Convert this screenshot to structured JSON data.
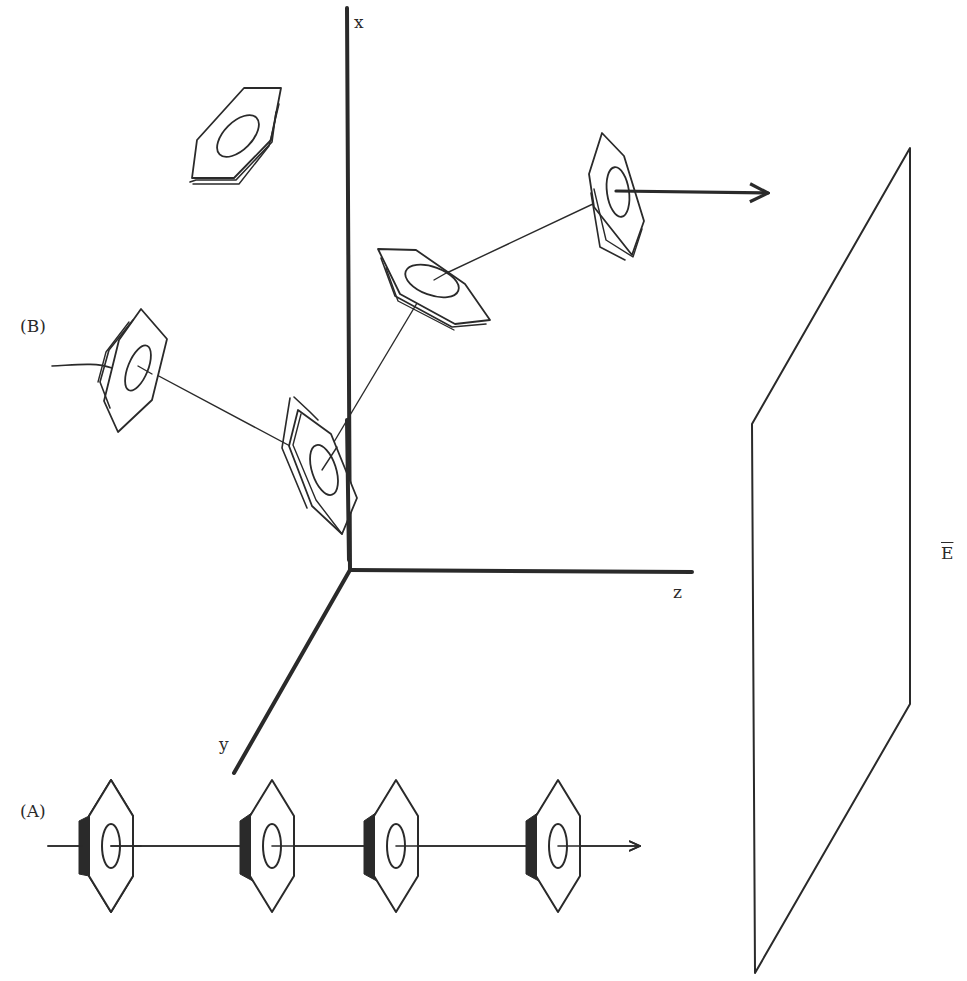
{
  "figure": {
    "type": "3D schematic diagram",
    "stroke_color": "#2a2a2a",
    "background": "#ffffff"
  },
  "axes": {
    "x": {
      "label": "x",
      "direction": "up"
    },
    "y": {
      "label": "y",
      "direction": "down-left"
    },
    "z": {
      "label": "z",
      "direction": "right"
    },
    "origin": [
      350,
      570
    ]
  },
  "field": {
    "label": "E",
    "overline": true,
    "plate": "parallelogram plane on right side"
  },
  "configurations": [
    {
      "id": "A",
      "label": "(A)",
      "description": "Four aligned rings on a straight horizontal line, faces perpendicular to path, arrow pointing right",
      "ring_count": 4
    },
    {
      "id": "B",
      "label": "(B)",
      "description": "Chain of tilted rings zigzagging through space, ending in a thick arrow toward the field plate",
      "ring_count": 4
    }
  ],
  "isolated_ring": {
    "description": "Single tilted ring near top-left, unattached"
  }
}
